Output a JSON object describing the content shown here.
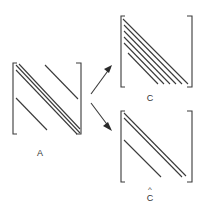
{
  "diagram": {
    "type": "matrix-decomposition",
    "stroke_color": "#3a3a3a",
    "nodes": [
      {
        "id": "A",
        "label": "A",
        "description": "banded matrix with three central diagonals, one upper off-diagonal and one lower off-diagonal"
      },
      {
        "id": "C",
        "label": "C",
        "description": "lower-banded matrix with main diagonal and four sub-diagonals"
      },
      {
        "id": "C_hat",
        "label": "C",
        "accent": "^",
        "description": "matrix with main diagonal, one sub-diagonal, and one further sub-diagonal"
      }
    ],
    "edges": [
      {
        "from": "A",
        "to": "C"
      },
      {
        "from": "A",
        "to": "C_hat"
      }
    ]
  }
}
